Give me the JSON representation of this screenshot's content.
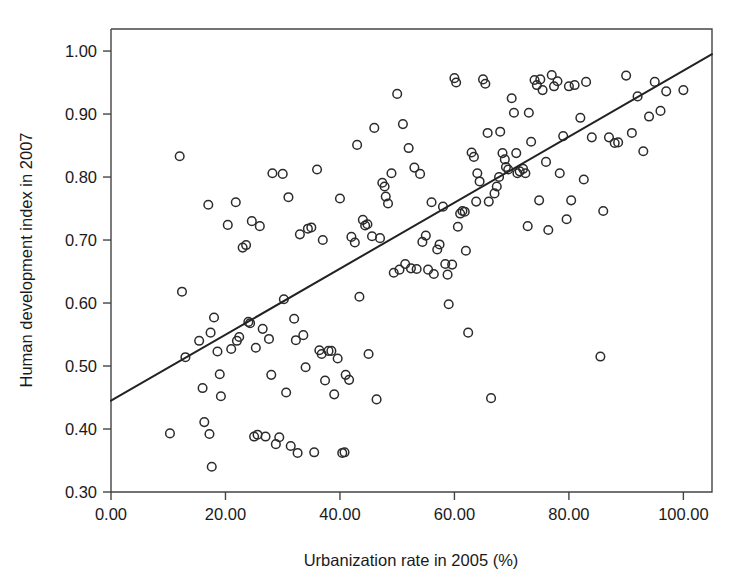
{
  "chart_data": {
    "type": "scatter",
    "title": "",
    "xlabel": "Urbanization rate in 2005 (%)",
    "ylabel": "Human development index in 2007",
    "xlim": [
      0,
      105
    ],
    "ylim": [
      0.3,
      1.035
    ],
    "grid": false,
    "legend": null,
    "marker": "open-circle",
    "xticks": [
      0,
      20,
      40,
      60,
      80,
      100
    ],
    "xtick_labels": [
      "0.00",
      "20.00",
      "40.00",
      "60.00",
      "80.00",
      "100.00"
    ],
    "yticks": [
      0.3,
      0.4,
      0.5,
      0.6,
      0.7,
      0.8,
      0.9,
      1.0
    ],
    "ytick_labels": [
      "0.30",
      "0.40",
      "0.50",
      "0.60",
      "0.70",
      "0.80",
      "0.90",
      "1.00"
    ],
    "fit_line": {
      "type": "linear-regression",
      "x_start": 0.0,
      "y_start": 0.445,
      "x_end": 105.0,
      "y_end": 0.995,
      "slope": 0.00524,
      "intercept": 0.445
    },
    "points": [
      [
        10.3,
        0.393
      ],
      [
        12.0,
        0.833
      ],
      [
        12.4,
        0.618
      ],
      [
        13.0,
        0.514
      ],
      [
        15.4,
        0.54
      ],
      [
        16.0,
        0.465
      ],
      [
        16.3,
        0.411
      ],
      [
        17.0,
        0.756
      ],
      [
        17.2,
        0.392
      ],
      [
        17.4,
        0.553
      ],
      [
        17.6,
        0.34
      ],
      [
        18.0,
        0.577
      ],
      [
        18.6,
        0.523
      ],
      [
        19.0,
        0.487
      ],
      [
        19.2,
        0.452
      ],
      [
        20.4,
        0.724
      ],
      [
        21.0,
        0.527
      ],
      [
        21.8,
        0.76
      ],
      [
        22.0,
        0.54
      ],
      [
        22.4,
        0.546
      ],
      [
        23.0,
        0.688
      ],
      [
        23.6,
        0.692
      ],
      [
        24.0,
        0.57
      ],
      [
        24.3,
        0.568
      ],
      [
        24.6,
        0.73
      ],
      [
        25.0,
        0.388
      ],
      [
        25.3,
        0.529
      ],
      [
        25.6,
        0.391
      ],
      [
        26.0,
        0.722
      ],
      [
        26.5,
        0.559
      ],
      [
        27.0,
        0.388
      ],
      [
        27.6,
        0.543
      ],
      [
        28.0,
        0.486
      ],
      [
        28.2,
        0.806
      ],
      [
        28.8,
        0.376
      ],
      [
        29.4,
        0.387
      ],
      [
        30.0,
        0.805
      ],
      [
        30.2,
        0.606
      ],
      [
        30.6,
        0.458
      ],
      [
        31.0,
        0.768
      ],
      [
        31.4,
        0.373
      ],
      [
        32.0,
        0.575
      ],
      [
        32.3,
        0.541
      ],
      [
        32.6,
        0.362
      ],
      [
        33.0,
        0.709
      ],
      [
        33.6,
        0.549
      ],
      [
        34.0,
        0.498
      ],
      [
        34.4,
        0.718
      ],
      [
        35.0,
        0.72
      ],
      [
        35.5,
        0.363
      ],
      [
        36.0,
        0.812
      ],
      [
        36.4,
        0.525
      ],
      [
        36.8,
        0.519
      ],
      [
        37.0,
        0.7
      ],
      [
        37.4,
        0.477
      ],
      [
        38.0,
        0.524
      ],
      [
        38.5,
        0.524
      ],
      [
        39.0,
        0.455
      ],
      [
        39.6,
        0.512
      ],
      [
        40.0,
        0.766
      ],
      [
        40.4,
        0.362
      ],
      [
        40.8,
        0.363
      ],
      [
        41.0,
        0.486
      ],
      [
        41.6,
        0.478
      ],
      [
        42.0,
        0.705
      ],
      [
        42.6,
        0.696
      ],
      [
        43.0,
        0.851
      ],
      [
        43.4,
        0.61
      ],
      [
        44.0,
        0.732
      ],
      [
        44.4,
        0.723
      ],
      [
        44.8,
        0.725
      ],
      [
        45.0,
        0.519
      ],
      [
        45.6,
        0.706
      ],
      [
        46.0,
        0.878
      ],
      [
        46.4,
        0.447
      ],
      [
        47.0,
        0.703
      ],
      [
        47.4,
        0.791
      ],
      [
        47.8,
        0.785
      ],
      [
        48.0,
        0.769
      ],
      [
        48.4,
        0.758
      ],
      [
        49.0,
        0.806
      ],
      [
        49.4,
        0.648
      ],
      [
        50.0,
        0.932
      ],
      [
        50.4,
        0.653
      ],
      [
        51.0,
        0.884
      ],
      [
        51.4,
        0.662
      ],
      [
        52.0,
        0.846
      ],
      [
        52.4,
        0.655
      ],
      [
        53.0,
        0.815
      ],
      [
        53.4,
        0.654
      ],
      [
        54.0,
        0.805
      ],
      [
        54.4,
        0.697
      ],
      [
        55.0,
        0.707
      ],
      [
        55.4,
        0.653
      ],
      [
        56.0,
        0.76
      ],
      [
        56.4,
        0.646
      ],
      [
        57.0,
        0.685
      ],
      [
        57.4,
        0.693
      ],
      [
        58.0,
        0.753
      ],
      [
        58.4,
        0.662
      ],
      [
        58.8,
        0.645
      ],
      [
        59.0,
        0.598
      ],
      [
        59.6,
        0.661
      ],
      [
        60.0,
        0.957
      ],
      [
        60.3,
        0.95
      ],
      [
        60.6,
        0.721
      ],
      [
        61.0,
        0.742
      ],
      [
        61.4,
        0.746
      ],
      [
        61.8,
        0.745
      ],
      [
        62.0,
        0.683
      ],
      [
        62.4,
        0.553
      ],
      [
        63.0,
        0.839
      ],
      [
        63.4,
        0.832
      ],
      [
        63.8,
        0.761
      ],
      [
        64.0,
        0.806
      ],
      [
        64.4,
        0.793
      ],
      [
        65.0,
        0.955
      ],
      [
        65.4,
        0.948
      ],
      [
        65.8,
        0.87
      ],
      [
        66.0,
        0.761
      ],
      [
        66.4,
        0.449
      ],
      [
        67.0,
        0.774
      ],
      [
        67.4,
        0.785
      ],
      [
        67.8,
        0.8
      ],
      [
        68.0,
        0.872
      ],
      [
        68.4,
        0.838
      ],
      [
        68.8,
        0.828
      ],
      [
        69.0,
        0.816
      ],
      [
        69.4,
        0.812
      ],
      [
        70.0,
        0.925
      ],
      [
        70.4,
        0.902
      ],
      [
        70.8,
        0.838
      ],
      [
        71.0,
        0.806
      ],
      [
        71.4,
        0.809
      ],
      [
        72.0,
        0.813
      ],
      [
        72.4,
        0.806
      ],
      [
        72.8,
        0.722
      ],
      [
        73.0,
        0.902
      ],
      [
        73.4,
        0.856
      ],
      [
        74.0,
        0.954
      ],
      [
        74.4,
        0.946
      ],
      [
        74.8,
        0.763
      ],
      [
        75.0,
        0.955
      ],
      [
        75.4,
        0.938
      ],
      [
        76.0,
        0.824
      ],
      [
        76.4,
        0.716
      ],
      [
        77.0,
        0.962
      ],
      [
        77.4,
        0.944
      ],
      [
        78.0,
        0.952
      ],
      [
        78.4,
        0.806
      ],
      [
        79.0,
        0.865
      ],
      [
        79.6,
        0.733
      ],
      [
        80.0,
        0.944
      ],
      [
        80.4,
        0.763
      ],
      [
        81.0,
        0.946
      ],
      [
        82.0,
        0.894
      ],
      [
        82.6,
        0.796
      ],
      [
        83.0,
        0.951
      ],
      [
        84.0,
        0.863
      ],
      [
        85.5,
        0.515
      ],
      [
        86.0,
        0.746
      ],
      [
        87.0,
        0.863
      ],
      [
        88.0,
        0.854
      ],
      [
        88.6,
        0.855
      ],
      [
        90.0,
        0.961
      ],
      [
        91.0,
        0.87
      ],
      [
        92.0,
        0.928
      ],
      [
        93.0,
        0.841
      ],
      [
        94.0,
        0.896
      ],
      [
        95.0,
        0.951
      ],
      [
        96.0,
        0.905
      ],
      [
        97.0,
        0.936
      ],
      [
        100.0,
        0.938
      ]
    ]
  },
  "axes": {
    "x_title": "Urbanization rate in 2005 (%)",
    "y_title": "Human development index in 2007",
    "x_tick_labels": [
      "0.00",
      "20.00",
      "40.00",
      "60.00",
      "80.00",
      "100.00"
    ],
    "y_tick_labels": [
      "1.00",
      "0.90",
      "0.80",
      "0.70",
      "0.60",
      "0.50",
      "0.40",
      "0.30"
    ]
  },
  "colors": {
    "background": "#ffffff",
    "marker_stroke": "#2b2b2b",
    "frame": "#444444",
    "fit_line": "#222222",
    "text": "#1a1a1a"
  }
}
